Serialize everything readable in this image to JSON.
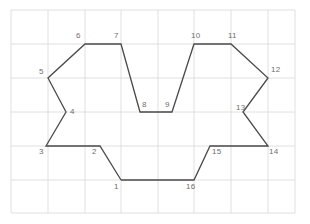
{
  "figure": {
    "canvas": {
      "width": 310,
      "height": 224,
      "background": "#ffffff"
    },
    "grid": {
      "color": "#d8d8d8",
      "line_width": 0.8,
      "x_lines": [
        11,
        48,
        85,
        121,
        158,
        194,
        231,
        268,
        295
      ],
      "y_lines": [
        10,
        44,
        78,
        112,
        146,
        180,
        213
      ],
      "cell_width": 36.7,
      "cell_height": 34
    },
    "polygon": {
      "stroke": "#4a4a4a",
      "stroke_width": 1.3,
      "fill": "none",
      "closed": true,
      "vertex_count": 16,
      "points": "121,180 100,146 46,146 66,112 48,78 85,44 121,44 140,112 172,112 194,44 231,44 268,78 243,112 268,146 210,146 194,180"
    },
    "labels": [
      {
        "text": "1",
        "x": 114,
        "y": 183
      },
      {
        "text": "2",
        "x": 92,
        "y": 148
      },
      {
        "text": "3",
        "x": 39,
        "y": 148
      },
      {
        "text": "4",
        "x": 70,
        "y": 108
      },
      {
        "text": "5",
        "x": 39,
        "y": 68
      },
      {
        "text": "6",
        "x": 76,
        "y": 32
      },
      {
        "text": "7",
        "x": 114,
        "y": 32
      },
      {
        "text": "8",
        "x": 142,
        "y": 101
      },
      {
        "text": "9",
        "x": 165,
        "y": 101
      },
      {
        "text": "10",
        "x": 191,
        "y": 32
      },
      {
        "text": "11",
        "x": 228,
        "y": 32
      },
      {
        "text": "12",
        "x": 271,
        "y": 66
      },
      {
        "text": "13",
        "x": 236,
        "y": 104
      },
      {
        "text": "14",
        "x": 269,
        "y": 148
      },
      {
        "text": "15",
        "x": 212,
        "y": 148
      },
      {
        "text": "16",
        "x": 186,
        "y": 183
      }
    ],
    "label_color": "#6e6e6e",
    "label_font_size": 8
  }
}
